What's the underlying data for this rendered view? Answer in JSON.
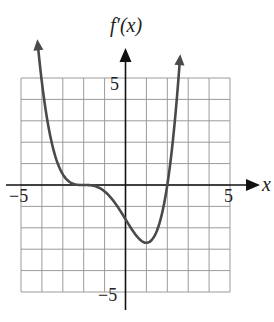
{
  "chart_data": {
    "type": "line",
    "title": "",
    "ylabel": "f'(x)",
    "xlabel": "x",
    "xlim": [
      -5,
      5
    ],
    "ylim": [
      -5,
      5
    ],
    "grid": true,
    "x_tick_labels": [
      "-5",
      "5"
    ],
    "y_tick_labels": [
      "5",
      "-5"
    ],
    "function_estimate": "0.1*(x+2)^3*(x-2)",
    "series": [
      {
        "name": "f'(x)",
        "x": [
          -4.2,
          -4.0,
          -3.5,
          -3.0,
          -2.5,
          -2.0,
          -1.5,
          -1.0,
          -0.5,
          0.0,
          0.5,
          1.0,
          1.5,
          2.0,
          2.3,
          2.6
        ],
        "y": [
          6.6,
          4.8,
          2.0,
          0.5,
          0.06,
          0.0,
          -0.04,
          -0.3,
          -1.1,
          -1.6,
          -2.3,
          -2.7,
          -2.1,
          0.0,
          2.3,
          5.8
        ]
      }
    ],
    "features": {
      "zero_flat_at": -2,
      "zero_crossing_at": 2,
      "minimum": [
        1,
        -2.7
      ],
      "arrows_at_ends": true
    }
  },
  "labels": {
    "y_axis": "f′(x)",
    "x_axis": "x",
    "x_min": "−5",
    "x_max": "5",
    "y_max": "5",
    "y_min": "−5"
  },
  "colors": {
    "curve": "#4a4a4a",
    "axis": "#111111",
    "grid": "#9a9a9a"
  }
}
